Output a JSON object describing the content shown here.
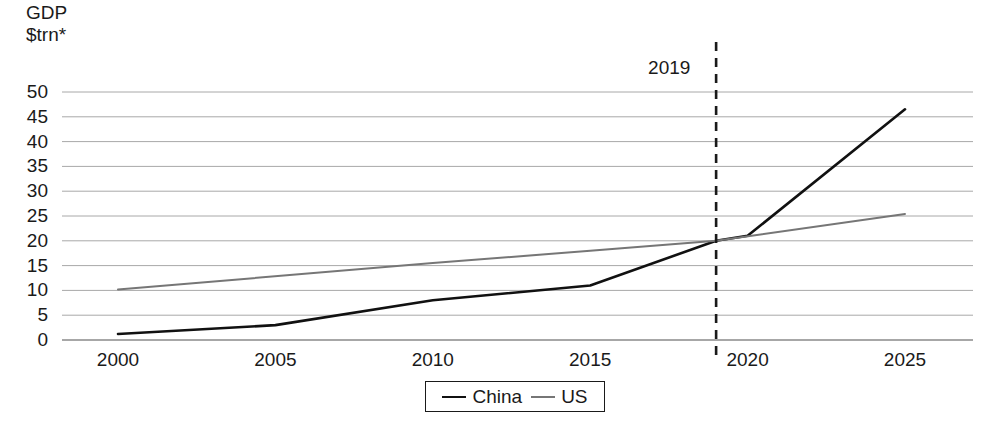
{
  "chart_data": {
    "type": "line",
    "title": "",
    "ylabel_lines": [
      "GDP",
      "$trn*"
    ],
    "xlabel": "",
    "x": [
      2000,
      2001,
      2002,
      2003,
      2004,
      2005,
      2006,
      2007,
      2008,
      2009,
      2010,
      2011,
      2012,
      2013,
      2014,
      2015,
      2016,
      2017,
      2018,
      2019,
      2020,
      2021,
      2022,
      2023,
      2024,
      2025
    ],
    "xlim": [
      2000,
      2025
    ],
    "ylim": [
      0,
      50
    ],
    "yticks": [
      0,
      5,
      10,
      15,
      20,
      25,
      30,
      35,
      40,
      45,
      50
    ],
    "xticks": [
      2000,
      2005,
      2010,
      2015,
      2020,
      2025
    ],
    "grid": "horizontal",
    "legend_position": "bottom-center",
    "series": [
      {
        "name": "China",
        "color": "#111111",
        "width": 2.6,
        "values": [
          1.2,
          1.4,
          1.5,
          1.7,
          2.0,
          2.3,
          2.8,
          3.6,
          4.6,
          5.1,
          6.1,
          7.6,
          8.6,
          9.6,
          10.5,
          11.1,
          11.2,
          12.3,
          13.9,
          14.3,
          14.7,
          17.8,
          23.5,
          29.2,
          37.0,
          46.5
        ]
      },
      {
        "name": "US",
        "color": "#767676",
        "width": 2.0,
        "values": [
          10.3,
          10.6,
          11.0,
          11.5,
          12.2,
          13.0,
          13.8,
          14.5,
          14.8,
          14.5,
          15.0,
          15.6,
          16.3,
          16.8,
          17.6,
          18.2,
          18.7,
          19.5,
          20.6,
          21.4,
          21.0,
          22.0,
          22.9,
          23.7,
          24.6,
          25.4
        ]
      }
    ],
    "annotations": [
      {
        "label": "2019",
        "type": "vertical-dashed-line",
        "x": 2019,
        "color": "#1a1a1a"
      }
    ],
    "rendered_points": {
      "china": [
        [
          2000,
          1.2
        ],
        [
          2005,
          3.0
        ],
        [
          2010,
          8.0
        ],
        [
          2015,
          11.0
        ],
        [
          2019,
          20.0
        ],
        [
          2020,
          21.0
        ],
        [
          2025,
          46.5
        ]
      ],
      "us": [
        [
          2000,
          10.2
        ],
        [
          2010,
          15.5
        ],
        [
          2015,
          18.0
        ],
        [
          2019,
          20.0
        ],
        [
          2025,
          25.4
        ]
      ]
    }
  },
  "legend": {
    "items": [
      {
        "label": "China"
      },
      {
        "label": "US"
      }
    ]
  },
  "axis": {
    "y_title_line1": "GDP",
    "y_title_line2": "$trn*",
    "y_labels": [
      "50",
      "45",
      "40",
      "35",
      "30",
      "25",
      "20",
      "15",
      "10",
      "5",
      "0"
    ],
    "x_labels": [
      "2000",
      "2005",
      "2010",
      "2015",
      "2020",
      "2025"
    ]
  },
  "annotation": {
    "year_marker": "2019"
  }
}
